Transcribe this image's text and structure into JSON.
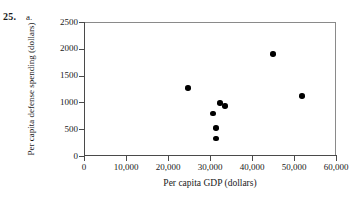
{
  "problem": {
    "number": "25.",
    "part": "a."
  },
  "chart_data": {
    "type": "scatter",
    "title": "",
    "xlabel": "Per capita GDP (dollars)",
    "ylabel": "Per capita defense spending (dollars)",
    "xlim": [
      0,
      60000
    ],
    "ylim": [
      0,
      2500
    ],
    "grid": false,
    "legend": false,
    "xticks": [
      0,
      10000,
      20000,
      30000,
      40000,
      50000,
      60000
    ],
    "xtick_labels": [
      "0",
      "10,000",
      "20,000",
      "30,000",
      "40,000",
      "50,000",
      "60,000"
    ],
    "yticks": [
      0,
      500,
      1000,
      1500,
      2000,
      2500
    ],
    "ytick_labels": [
      "0",
      "500",
      "1000",
      "1500",
      "2000",
      "2500"
    ],
    "marker": "filled-circle",
    "marker_color": "#000000",
    "points": [
      {
        "x": 24800,
        "y": 1270
      },
      {
        "x": 30700,
        "y": 790
      },
      {
        "x": 32400,
        "y": 985
      },
      {
        "x": 33600,
        "y": 930
      },
      {
        "x": 31400,
        "y": 520
      },
      {
        "x": 31400,
        "y": 330
      },
      {
        "x": 45000,
        "y": 1900
      },
      {
        "x": 51900,
        "y": 1120
      }
    ]
  }
}
